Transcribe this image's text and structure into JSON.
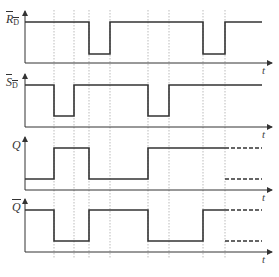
{
  "diagram": {
    "type": "timing-diagram",
    "guides_x": [
      54,
      74,
      89,
      110,
      148,
      169,
      203,
      225
    ],
    "time_label": "t",
    "signals": [
      {
        "name": "RD_bar",
        "label_main": "R",
        "label_sub": "D",
        "overbar": true,
        "high_y": 22,
        "low_y": 54,
        "axis_y": 63,
        "path": "M25,22 L89,22 L89,54 L110,54 L110,22 L203,22 L203,54 L225,54 L225,22 L262,22"
      },
      {
        "name": "SD_bar",
        "label_main": "S",
        "label_sub": "D",
        "overbar": true,
        "high_y": 85,
        "low_y": 116,
        "axis_y": 127,
        "path": "M25,85 L54,85 L54,116 L74,116 L74,85 L148,85 L148,116 L169,116 L169,85 L225,85 L262,85"
      },
      {
        "name": "Q",
        "label_main": "Q",
        "label_sub": "",
        "overbar": false,
        "high_y": 148,
        "low_y": 179,
        "axis_y": 190,
        "path": "M25,179 L54,179 L54,148 L89,148 L89,179 L148,179 L148,148 L225,148",
        "dashed": "M225,148 L262,148 M225,179 L262,179"
      },
      {
        "name": "Q_bar",
        "label_main": "Q",
        "label_sub": "",
        "overbar": true,
        "high_y": 210,
        "low_y": 241,
        "axis_y": 252,
        "path": "M25,210 L54,210 L54,241 L89,241 L89,210 L148,210 L148,241 L203,241 L203,210 L225,210",
        "dashed": "M225,210 L262,210 M225,241 L262,241"
      }
    ]
  }
}
